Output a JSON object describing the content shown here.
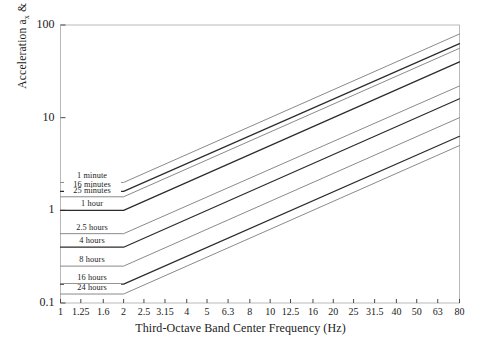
{
  "chart_data": {
    "type": "line",
    "title": "",
    "xlabel": "Third-Octave Band Center Frequency (Hz)",
    "ylabel_text": "Acceleration ax & ay (ms-2) rms",
    "xscale": "log",
    "yscale": "log",
    "xlim": [
      1,
      80
    ],
    "ylim": [
      0.1,
      100
    ],
    "grid": false,
    "legend": "inline-labels-left",
    "xticks": [
      "1",
      "1.25",
      "1.6",
      "2",
      "2.5",
      "3.15",
      "4",
      "5",
      "6.3",
      "8",
      "10",
      "12.5",
      "16",
      "20",
      "25",
      "31.5",
      "40",
      "50",
      "63",
      "80"
    ],
    "xtick_values": [
      1,
      1.25,
      1.6,
      2,
      2.5,
      3.15,
      4,
      5,
      6.3,
      8,
      10,
      12.5,
      16,
      20,
      25,
      31.5,
      40,
      50,
      63,
      80
    ],
    "yticks": [
      "0.1",
      "1",
      "10",
      "100"
    ],
    "ytick_values": [
      0.1,
      1,
      10,
      100
    ],
    "breakpoint_hz": 2,
    "series": [
      {
        "name": "1 minute",
        "label": "1 minute",
        "plateau": 2.0,
        "end": 80.0,
        "color": "#8a8a8a",
        "width": 1.0
      },
      {
        "name": "16 minutes",
        "label": "16 minutes",
        "plateau": 1.6,
        "end": 63.0,
        "color": "#2b2b2b",
        "width": 1.2
      },
      {
        "name": "25 minutes",
        "label": "25 minutes",
        "plateau": 1.4,
        "end": 56.0,
        "color": "#8a8a8a",
        "width": 1.0
      },
      {
        "name": "1 hour",
        "label": "1 hour",
        "plateau": 1.0,
        "end": 40.0,
        "color": "#2b2b2b",
        "width": 1.2
      },
      {
        "name": "2.5 hours",
        "label": "2.5 hours",
        "plateau": 0.56,
        "end": 22.0,
        "color": "#8a8a8a",
        "width": 1.0
      },
      {
        "name": "4 hours",
        "label": "4 hours",
        "plateau": 0.4,
        "end": 16.0,
        "color": "#2b2b2b",
        "width": 1.2
      },
      {
        "name": "8 hours",
        "label": "8 hours",
        "plateau": 0.25,
        "end": 10.0,
        "color": "#8a8a8a",
        "width": 1.0
      },
      {
        "name": "16 hours",
        "label": "16 hours",
        "plateau": 0.16,
        "end": 6.3,
        "color": "#2b2b2b",
        "width": 1.2
      },
      {
        "name": "24 hours",
        "label": "24 hours",
        "plateau": 0.125,
        "end": 5.0,
        "color": "#8a8a8a",
        "width": 1.0
      }
    ]
  },
  "axes": {
    "y_title_parts": {
      "pre": "Acceleration a",
      "sub1": "x",
      "mid": " & a",
      "sub2": "y",
      "post": " (ms",
      "exp": "-2",
      "tail": ") rms"
    },
    "x_title": "Third-Octave Band Center Frequency (Hz)"
  }
}
